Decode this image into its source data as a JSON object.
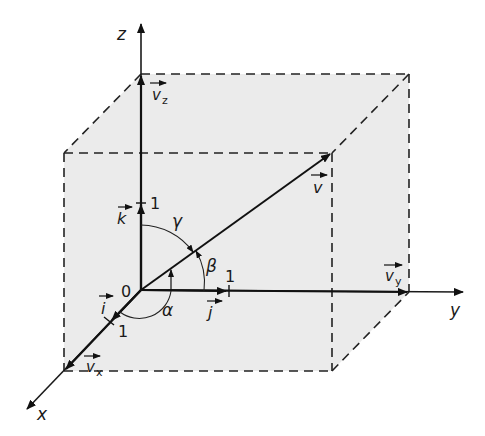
{
  "diagram": {
    "colors": {
      "box_fill": "#ebebeb",
      "ink": "#1a1a1a",
      "background": "#ffffff"
    },
    "axes": {
      "x": {
        "label": "x",
        "unit_label": "1",
        "unit_vector": "i"
      },
      "y": {
        "label": "y",
        "unit_label": "1",
        "unit_vector": "j"
      },
      "z": {
        "label": "z",
        "unit_label": "1",
        "unit_vector": "k"
      }
    },
    "origin_label": "0",
    "vector": {
      "name": "v"
    },
    "components": [
      {
        "name": "v",
        "sub": "x"
      },
      {
        "name": "v",
        "sub": "y"
      },
      {
        "name": "v",
        "sub": "z"
      }
    ],
    "angles": [
      {
        "symbol": "α",
        "between": "v and x-axis"
      },
      {
        "symbol": "β",
        "between": "v and y-axis"
      },
      {
        "symbol": "γ",
        "between": "v and z-axis"
      }
    ],
    "text": {
      "x": "x",
      "y": "y",
      "z": "z",
      "zero": "0",
      "one": "1",
      "i": "i",
      "j": "j",
      "k": "k",
      "v": "v",
      "vx": "v",
      "vy": "v",
      "vz": "v",
      "sub_x": "x",
      "sub_y": "y",
      "sub_z": "z",
      "alpha": "α",
      "beta": "β",
      "gamma": "γ"
    }
  }
}
